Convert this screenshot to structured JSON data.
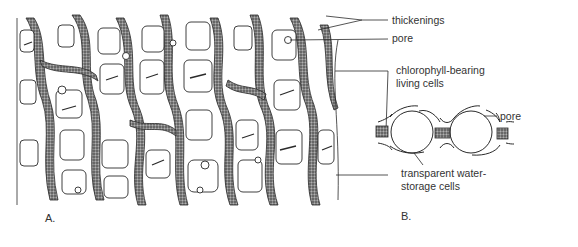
{
  "figure": {
    "panels": [
      {
        "id": "A",
        "label": "A.",
        "description": "surface view of cell network"
      },
      {
        "id": "B",
        "label": "B.",
        "description": "cross-section of cells"
      }
    ],
    "annotations": [
      {
        "id": "thickenings",
        "text": "thickenings"
      },
      {
        "id": "pore-a",
        "text": "pore"
      },
      {
        "id": "chlorophyll",
        "lines": [
          "chlorophyll-bearing",
          "living cells"
        ]
      },
      {
        "id": "pore-b",
        "text": "pore"
      },
      {
        "id": "water-storage",
        "lines": [
          "transparent water-",
          "storage cells"
        ]
      }
    ]
  },
  "colors": {
    "line": "#2a2a2a",
    "stipple": "#5a5a5a",
    "background": "#ffffff"
  }
}
